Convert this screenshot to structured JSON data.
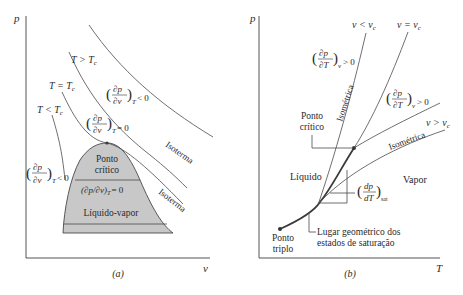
{
  "diagram": {
    "panel_a": {
      "caption": "(a)",
      "y_axis_label": "p",
      "x_axis_label": "v",
      "isotherm_labels": {
        "above_critical": "T > T",
        "at_critical": "T = T",
        "below_critical": "T < T",
        "subscript": "c"
      },
      "derivative_labels": {
        "negative_upper": {
          "num": "∂p",
          "den": "∂v",
          "sub": "T",
          "rel": "< 0"
        },
        "zero": {
          "num": "∂p",
          "den": "∂v",
          "sub": "T",
          "rel": "= 0"
        },
        "negative_left": {
          "num": "∂p",
          "den": "∂v",
          "sub": "T",
          "rel": "< 0"
        }
      },
      "dome_labels": {
        "critical_point_line1": "Ponto",
        "critical_point_line2": "crítico",
        "inline_derivative": "(∂p/∂v)",
        "inline_sub": "T",
        "inline_rel": "= 0",
        "region": "Líquido-vapor"
      },
      "curve_labels": {
        "isotherm_1": "Isoterma",
        "isotherm_2": "Isoterma"
      },
      "colors": {
        "dome_fill": "#c8c8c8",
        "line": "#4a4a4a"
      }
    },
    "panel_b": {
      "caption": "(b)",
      "y_axis_label": "p",
      "x_axis_label": "T",
      "isometric_labels": {
        "less_than": "v < v",
        "equal": "v = v",
        "greater_than": "v > v",
        "subscript": "c"
      },
      "curve_labels": {
        "isometric_1": "Isométrica",
        "isometric_2": "Isométrica"
      },
      "derivative_labels": {
        "upper": {
          "num": "∂p",
          "den": "∂T",
          "sub": "v",
          "rel": "> 0"
        },
        "middle": {
          "num": "∂p",
          "den": "∂T",
          "sub": "v",
          "rel": "> 0"
        },
        "saturation": {
          "num": "dp",
          "den": "dT",
          "sub": "sat"
        }
      },
      "region_labels": {
        "liquid": "Líquido",
        "vapor": "Vapor",
        "critical_point_line1": "Ponto",
        "critical_point_line2": "crítico",
        "triple_point_line1": "Ponto",
        "triple_point_line2": "triplo",
        "saturation_locus_line1": "Lugar geométrico dos",
        "saturation_locus_line2": "estados de saturação"
      }
    }
  }
}
